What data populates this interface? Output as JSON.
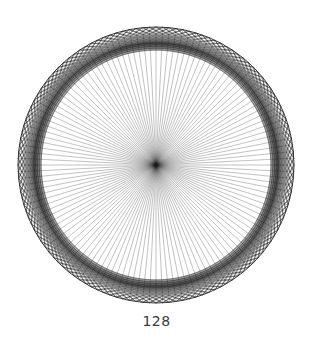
{
  "figure": {
    "caption": "128",
    "points": 128
  },
  "diagram": {
    "center": [
      156,
      165
    ],
    "outer_radius": 138,
    "inner_envelope_radius": 95,
    "stroke_color": "#1a1a1a",
    "outer_circle_color": "#333333",
    "chord_groups": [
      {
        "name": "ring-chords",
        "step_offsets": [
          20,
          21,
          22,
          23,
          24
        ],
        "opacity": 0.32
      },
      {
        "name": "radial-diameters",
        "step_offsets": [
          64
        ],
        "opacity": 0.45
      }
    ]
  }
}
